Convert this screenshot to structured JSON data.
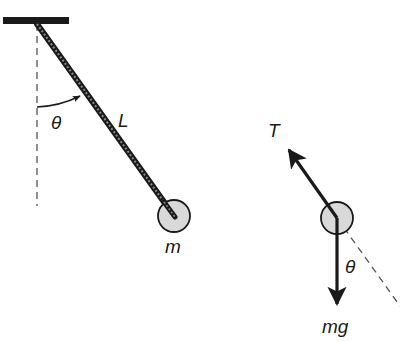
{
  "diagram": {
    "colors": {
      "ink": "#1a1a1a",
      "bob_fill": "#d9d9d9",
      "dashed": "#555555",
      "background": "#ffffff"
    },
    "pendulum": {
      "ceiling": {
        "x": 3,
        "y": 17,
        "width": 66,
        "height": 7
      },
      "pivot": {
        "x": 37,
        "y": 24
      },
      "bob": {
        "cx": 174,
        "cy": 216,
        "r": 16
      },
      "vertical_reference": {
        "x": 37,
        "y1": 24,
        "y2": 206
      },
      "labels": {
        "length": "L",
        "angle": "θ",
        "mass": "m"
      }
    },
    "free_body": {
      "bob": {
        "cx": 337,
        "cy": 218,
        "r": 16
      },
      "tension_arrow": {
        "x1": 337,
        "y1": 218,
        "x2": 287,
        "y2": 147
      },
      "gravity_arrow": {
        "x1": 337,
        "y1": 218,
        "x2": 337,
        "y2": 307
      },
      "string_extension": {
        "x1": 337,
        "y1": 218,
        "x2": 400,
        "y2": 306
      },
      "labels": {
        "tension": "T",
        "angle": "θ",
        "weight": "mg"
      }
    }
  }
}
